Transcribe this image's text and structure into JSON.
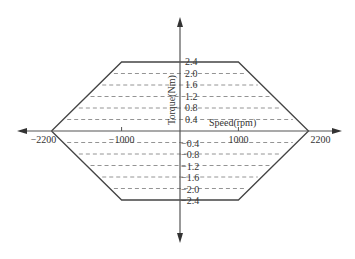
{
  "chart_data": {
    "type": "line",
    "title": "",
    "xlabel": "Speed(rpm)",
    "ylabel": "Torque(Nm)",
    "xlim": [
      -2200,
      2200
    ],
    "ylim": [
      -2.4,
      2.4
    ],
    "x_ticks": [
      {
        "value": -2200,
        "label": "−2200"
      },
      {
        "value": -1000,
        "label": "−1000"
      },
      {
        "value": 1000,
        "label": "1000"
      },
      {
        "value": 2200,
        "label": "2200"
      }
    ],
    "y_ticks_positive": [
      {
        "value": 2.4,
        "label": "2.4"
      },
      {
        "value": 2.0,
        "label": "2.0"
      },
      {
        "value": 1.6,
        "label": "1.6"
      },
      {
        "value": 1.2,
        "label": "1.2"
      },
      {
        "value": 0.8,
        "label": "0.8"
      },
      {
        "value": 0.4,
        "label": "0.4"
      }
    ],
    "y_ticks_negative": [
      {
        "value": -0.4,
        "label": "−0.4"
      },
      {
        "value": -0.8,
        "label": "−0.8"
      },
      {
        "value": -1.2,
        "label": "−1.2"
      },
      {
        "value": -1.6,
        "label": "−1.6"
      },
      {
        "value": -2.0,
        "label": "−2.0"
      },
      {
        "value": -2.4,
        "label": "−2.4"
      }
    ],
    "series": [
      {
        "name": "Torque-speed envelope",
        "style": "solid",
        "points": [
          [
            -2200,
            0
          ],
          [
            -1000,
            2.4
          ],
          [
            1000,
            2.4
          ],
          [
            2200,
            0
          ],
          [
            1000,
            -2.4
          ],
          [
            -1000,
            -2.4
          ],
          [
            -2200,
            0
          ]
        ]
      }
    ],
    "dashed_levels": [
      2.0,
      1.6,
      1.2,
      0.8,
      0.4,
      -0.4,
      -0.8,
      -1.2,
      -1.6,
      -2.0
    ],
    "grid": false,
    "legend": "none",
    "colors": {
      "axis": "#555555",
      "envelope": "#444444",
      "dashed": "#888888"
    }
  }
}
